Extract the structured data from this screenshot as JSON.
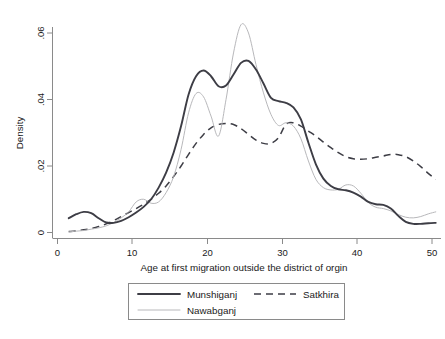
{
  "chart_data": {
    "type": "line",
    "title": "",
    "subtitle": "",
    "xlabel": "Age at first migration outside the district of orgin",
    "ylabel": "Density",
    "xlim": [
      0,
      51
    ],
    "ylim": [
      0,
      0.066
    ],
    "grid": false,
    "legend_position": "bottom",
    "xticks": [
      0,
      10,
      20,
      30,
      40,
      50
    ],
    "xticklabels": [
      "0",
      "10",
      "20",
      "30",
      "40",
      "50"
    ],
    "yticks": [
      0,
      0.02,
      0.04,
      0.06
    ],
    "yticklabels": [
      "0",
      ".02",
      ".04",
      ".06"
    ],
    "series": [
      {
        "name": "Munshiganj",
        "style": "solid-thick",
        "color": "#3d3d45",
        "x": [
          1.5,
          2.5,
          3.5,
          4.5,
          5.5,
          6.5,
          7.5,
          8.5,
          9.5,
          10.5,
          11.5,
          12.5,
          13.5,
          14.5,
          15.5,
          16.5,
          17.5,
          18.5,
          19.5,
          20.5,
          21.5,
          22.5,
          23.5,
          24.5,
          25.5,
          26.5,
          27.5,
          28.5,
          29.5,
          30.5,
          31.5,
          32.5,
          33.5,
          34.5,
          35.5,
          36.5,
          37.5,
          38.5,
          39.5,
          40.5,
          41.5,
          42.5,
          43.5,
          44.5,
          45.5,
          46.5,
          47.5,
          48.5,
          49.5,
          50.5
        ],
        "y": [
          0.0043,
          0.0055,
          0.0062,
          0.0058,
          0.0043,
          0.003,
          0.0029,
          0.0035,
          0.0046,
          0.006,
          0.0077,
          0.01,
          0.0135,
          0.018,
          0.024,
          0.032,
          0.0415,
          0.047,
          0.0487,
          0.047,
          0.044,
          0.0442,
          0.0475,
          0.051,
          0.0516,
          0.049,
          0.0448,
          0.0405,
          0.0395,
          0.039,
          0.0376,
          0.034,
          0.027,
          0.0205,
          0.0162,
          0.014,
          0.013,
          0.0127,
          0.012,
          0.0108,
          0.0092,
          0.0085,
          0.0083,
          0.0072,
          0.005,
          0.0032,
          0.0026,
          0.0026,
          0.0028,
          0.0029
        ]
      },
      {
        "name": "Nawabganj",
        "style": "solid-thin",
        "color": "#b8b8bb",
        "x": [
          1.5,
          2.5,
          3.5,
          4.5,
          5.5,
          6.5,
          7.5,
          8.5,
          9.5,
          10.5,
          11.5,
          12.5,
          13.5,
          14.5,
          15.5,
          16.5,
          17.5,
          18.5,
          19.5,
          20.5,
          21.5,
          22.5,
          23.5,
          24.5,
          25.5,
          26.5,
          27.5,
          28.5,
          29.5,
          30.5,
          31.5,
          32.5,
          33.5,
          34.5,
          35.5,
          36.5,
          37.5,
          38.5,
          39.5,
          40.5,
          41.5,
          42.5,
          43.5,
          44.5,
          45.5,
          46.5,
          47.5,
          48.5,
          49.5,
          50.5
        ],
        "y": [
          0.0002,
          0.0004,
          0.0006,
          0.001,
          0.0014,
          0.002,
          0.003,
          0.0044,
          0.0062,
          0.0092,
          0.01,
          0.0088,
          0.0092,
          0.012,
          0.0168,
          0.025,
          0.036,
          0.0418,
          0.0408,
          0.035,
          0.029,
          0.04,
          0.054,
          0.0625,
          0.06,
          0.0505,
          0.042,
          0.0355,
          0.0322,
          0.033,
          0.032,
          0.0282,
          0.0215,
          0.016,
          0.0135,
          0.0128,
          0.013,
          0.0143,
          0.014,
          0.0118,
          0.009,
          0.0076,
          0.0072,
          0.0065,
          0.0054,
          0.0046,
          0.0044,
          0.0048,
          0.0056,
          0.0062
        ]
      },
      {
        "name": "Satkhira",
        "style": "dashed",
        "color": "#3d3d45",
        "x": [
          1.5,
          2.5,
          3.5,
          4.5,
          5.5,
          6.5,
          7.5,
          8.5,
          9.5,
          10.5,
          11.5,
          12.5,
          13.5,
          14.5,
          15.5,
          16.5,
          17.5,
          18.5,
          19.5,
          20.5,
          21.5,
          22.5,
          23.5,
          24.5,
          25.5,
          26.5,
          27.5,
          28.5,
          29.5,
          30.5,
          31.5,
          32.5,
          33.5,
          34.5,
          35.5,
          36.5,
          37.5,
          38.5,
          39.5,
          40.5,
          41.5,
          42.5,
          43.5,
          44.5,
          45.5,
          46.5,
          47.5,
          48.5,
          49.5,
          50.5
        ],
        "y": [
          0.0003,
          0.0005,
          0.0008,
          0.0012,
          0.0018,
          0.0026,
          0.0036,
          0.0048,
          0.006,
          0.0072,
          0.0085,
          0.01,
          0.0118,
          0.014,
          0.0168,
          0.02,
          0.0235,
          0.0268,
          0.0295,
          0.0315,
          0.0325,
          0.0328,
          0.0325,
          0.0312,
          0.0295,
          0.0278,
          0.0268,
          0.0268,
          0.0285,
          0.0325,
          0.033,
          0.032,
          0.0305,
          0.029,
          0.0272,
          0.0255,
          0.024,
          0.0228,
          0.0222,
          0.022,
          0.0222,
          0.0226,
          0.023,
          0.0235,
          0.0234,
          0.0228,
          0.0215,
          0.0198,
          0.0178,
          0.016
        ]
      }
    ]
  },
  "legend": {
    "entries": [
      {
        "label": "Munshiganj",
        "style": "solid-thick"
      },
      {
        "label": "Satkhira",
        "style": "dashed"
      },
      {
        "label": "Nawabganj",
        "style": "solid-thin"
      }
    ]
  },
  "axes": {
    "x_title": "Age at first migration outside the district of orgin",
    "y_title": "Density"
  }
}
